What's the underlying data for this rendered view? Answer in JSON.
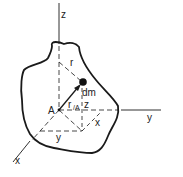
{
  "diagram": {
    "type": "rigid-body moment of inertia geometry",
    "labels": {
      "z_axis": "z",
      "y_axis": "y",
      "x_axis": "x",
      "origin": "A",
      "mass_element": "dm",
      "radius": "r",
      "position_vector_main": "r",
      "position_vector_sub": "/A",
      "z_component": "z",
      "x_component": "x",
      "y_component": "y"
    },
    "colors": {
      "stroke": "#1a1a1a",
      "background": "#ffffff"
    }
  }
}
